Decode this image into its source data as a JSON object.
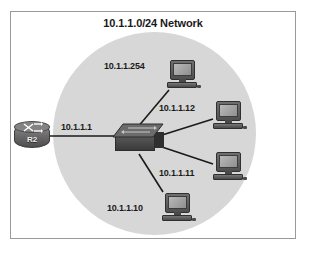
{
  "figure": {
    "title": "10.1.1.0/24 Network",
    "border_color": "#9a9a9a",
    "background_color": "#ffffff"
  },
  "cloud": {
    "name": "lan-segment-cloud",
    "color": "#d7d7d7",
    "shape": "circle"
  },
  "nodes": {
    "router": {
      "icon": "router-icon",
      "label": "R2",
      "interface_address": "10.1.1.1"
    },
    "switch": {
      "icon": "switch-icon",
      "label": ""
    },
    "hosts": [
      {
        "icon": "pc-icon",
        "address": "10.1.1.254"
      },
      {
        "icon": "pc-icon",
        "address": "10.1.1.12"
      },
      {
        "icon": "pc-icon",
        "address": "10.1.1.11"
      },
      {
        "icon": "pc-icon",
        "address": "10.1.1.10"
      }
    ]
  },
  "links": {
    "line_color": "#1a1a1a"
  }
}
